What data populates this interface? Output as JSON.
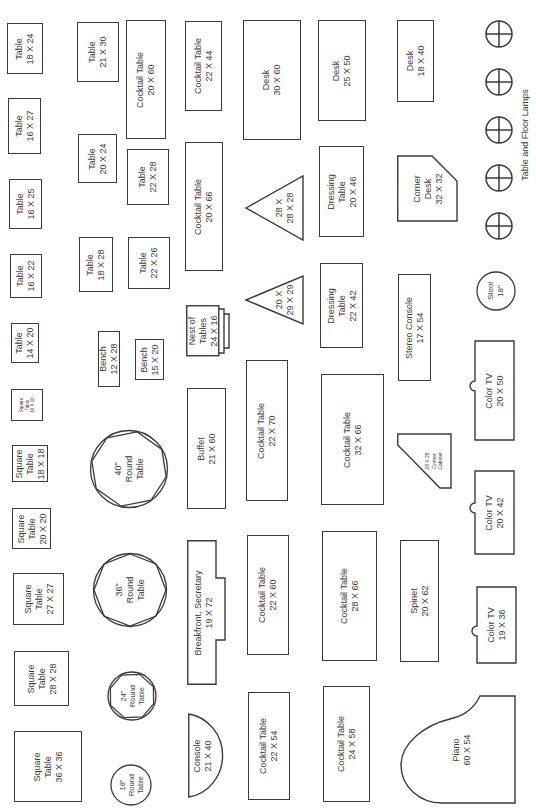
{
  "items": {
    "table_18x24": "Table\n18 X 24",
    "table_16x27": "Table\n16 X 27",
    "table_16x25": "Table\n16 X 25",
    "table_16x22": "Table\n16 X 22",
    "table_14x20": "Table\n14 X 20",
    "square_16x16": "Square\nTable\n16 X 16",
    "square_18x18": "Square\nTable\n18 X 18",
    "square_20x20": "Square\nTable\n20 X 20",
    "square_27x27": "Square\nTable\n27 X 27",
    "square_28x28": "Square\nTable\n28 X 28",
    "square_36x36": "Square\nTable\n36 X 36",
    "table_21x30": "Table\n21 X 30",
    "table_20x24": "Table\n20 X 24",
    "table_18x28": "Table\n18 X 28",
    "bench_12x28": "Bench\n12 X 28",
    "bench_15x20": "Bench\n15 X 20",
    "round_40": "40\"\nRound\nTable",
    "round_36": "36\"\nRound\nTable",
    "round_24": "24\"\nRound\nTable",
    "round_18": "18\"\nRound\nTable",
    "cocktail_20x60": "Cocktail Table\n20 X 60",
    "table_22x28": "Table\n22 X 28",
    "table_22x26": "Table\n22 X 26",
    "cocktail_22x44": "Cocktail Table\n22 X 44",
    "cocktail_20x66": "Cocktail Table\n20 X 66",
    "nest_of_tables": "Nest of\nTables\n24 X 16",
    "buffet": "Buffet\n21 X 60",
    "breakfront": "Breakfront, Secretary\n19 X 72",
    "console": "Console\n21 X 40",
    "desk_30x60": "Desk\n30 X 60",
    "triangle_28": "28 X\n28 X 28",
    "triangle_20": "20 X\n29 X 29",
    "cocktail_22x70": "Cocktail Table\n22 X 70",
    "cocktail_22x60": "Cocktail Table\n22 X 60",
    "cocktail_22x54": "Cocktail Table\n22 X 54",
    "desk_25x50": "Desk\n25 X 50",
    "dressing_20x46": "Dressing\nTable\n20 X 46",
    "dressing_22x42": "Dressing\nTable\n22 X 42",
    "cocktail_32x66": "Cocktail Table\n32 X 66",
    "cocktail_28x66": "Cocktail Table\n28 X 66",
    "cocktail_24x58": "Cocktail Table\n24 X 58",
    "desk_18x40": "Desk\n18 X 40",
    "corner_desk": "Corner\nDesk\n32 X 32",
    "stereo_console": "Stereo Console\n17 X 54",
    "corner_cabinet": "28 X 28\nCorner\nCabinet",
    "spinet": "Spinet\n20 X 62",
    "stool": "Stool\n18\"",
    "color_tv_50": "Color TV\n20 X 50",
    "color_tv_42": "Color TV\n20 X 42",
    "color_tv_36": "Color TV\n19 X 36",
    "piano": "Piano\n60 X 54",
    "lamps_caption": "Table and  Floor Lamps"
  },
  "colors": {
    "stroke": "#3a3a3a",
    "background": "#ffffff"
  }
}
